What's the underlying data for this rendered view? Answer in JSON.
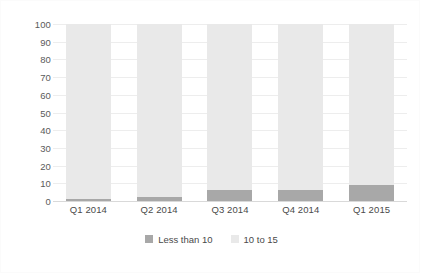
{
  "chart_data": {
    "type": "bar",
    "subtype": "100% stacked column",
    "title": "",
    "subtitle": "",
    "xlabel": "",
    "ylabel": "",
    "ylim": [
      0,
      100
    ],
    "yticks": [
      0,
      10,
      20,
      30,
      40,
      50,
      60,
      70,
      80,
      90,
      100
    ],
    "ytick_labels": [
      "0",
      "10",
      "20",
      "30",
      "40",
      "50",
      "60",
      "70",
      "80",
      "90",
      "100"
    ],
    "grid": true,
    "grid_axis": "y",
    "legend_position": "bottom-center",
    "categories": [
      "Q1 2014",
      "Q2 2014",
      "Q3 2014",
      "Q4 2014",
      "Q1 2015"
    ],
    "series": [
      {
        "name": "Less than 10",
        "color": "#a8a8a8",
        "values": [
          1,
          2,
          6,
          6,
          9
        ]
      },
      {
        "name": "10 to 15",
        "color": "#e9e9e9",
        "values": [
          99,
          98,
          94,
          94,
          91
        ]
      }
    ]
  },
  "colors": {
    "background": "#ffffff",
    "gridline": "#ededed",
    "axis_line": "#d9d9d9",
    "tick_text": "#4a4a4a",
    "series_dark": "#a8a8a8",
    "series_light": "#e9e9e9",
    "border": "#fbfbfb"
  }
}
